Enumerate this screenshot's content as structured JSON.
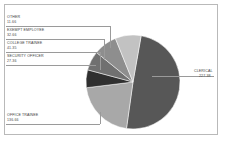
{
  "chart_data": {
    "type": "pie",
    "title": "",
    "subtitle": "",
    "xlabel": "",
    "ylabel": "",
    "legend_position": "callout-labels",
    "grid": false,
    "categories": [
      "CLERICAL",
      "OFFICE TRAINEE",
      "SECURITY OFFICER",
      "COLLEGE TRAINEE",
      "EXEMPT EMPLOYEE",
      "OTHER"
    ],
    "values": [
      227.38,
      136.66,
      27.36,
      41.35,
      32.66,
      11.66
    ],
    "value_labels": [
      "227.38",
      "136.66",
      "27.36",
      "41.35",
      "32.66",
      "11.66"
    ],
    "slice_colors": [
      "#575757",
      "#a8a8a8",
      "#2f2f2f",
      "#707070",
      "#8e8e8e",
      "#c2c2c2"
    ],
    "slices": [
      {
        "label": "CLERICAL",
        "value": 227.38,
        "value_label": "227.38",
        "color": "#575757",
        "start_deg": 10,
        "end_deg": 188
      },
      {
        "label": "OFFICE TRAINEE",
        "value": 136.66,
        "value_label": "136.66",
        "color": "#a8a8a8",
        "start_deg": 188,
        "end_deg": 263
      },
      {
        "label": "SECURITY OFFICER",
        "value": 27.36,
        "value_label": "27.36",
        "color": "#2f2f2f",
        "start_deg": 263,
        "end_deg": 285
      },
      {
        "label": "COLLEGE TRAINEE",
        "value": 41.35,
        "value_label": "41.35",
        "color": "#707070",
        "start_deg": 285,
        "end_deg": 309
      },
      {
        "label": "EXEMPT EMPLOYEE",
        "value": 32.66,
        "value_label": "32.66",
        "color": "#8e8e8e",
        "start_deg": 309,
        "end_deg": 338
      },
      {
        "label": "OTHER",
        "value": 11.66,
        "value_label": "11.66",
        "color": "#c2c2c2",
        "start_deg": 338,
        "end_deg": 370
      }
    ]
  },
  "callouts": {
    "other": {
      "label": "OTHER",
      "value": "11.66"
    },
    "exempt_employee": {
      "label": "EXEMPT EMPLOYEE",
      "value": "32.66"
    },
    "college_trainee": {
      "label": "COLLEGE TRAINEE",
      "value": "41.35"
    },
    "security_officer": {
      "label": "SECURITY OFFICER",
      "value": "27.36"
    },
    "office_trainee": {
      "label": "OFFICE TRAINEE",
      "value": "136.66"
    },
    "clerical": {
      "label": "CLERICAL",
      "value": "227.38"
    }
  },
  "style": {
    "frame_border": "#b9b9b9",
    "leader_line": "#9a9a9a",
    "background": "#ffffff",
    "text": "#3b3b3b"
  }
}
